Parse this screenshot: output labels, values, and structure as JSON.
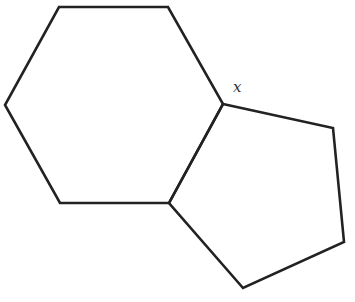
{
  "diagram": {
    "stroke_color": "#222222",
    "hexagon": {
      "points": [
        [
          59,
          7
        ],
        [
          168,
          7
        ],
        [
          223,
          104
        ],
        [
          169,
          203
        ],
        [
          60,
          203
        ],
        [
          5,
          105
        ]
      ]
    },
    "pentagon": {
      "points": [
        [
          223,
          104
        ],
        [
          333,
          128
        ],
        [
          344,
          242
        ],
        [
          243,
          288
        ],
        [
          169,
          203
        ]
      ]
    },
    "angle_label": {
      "text": "x",
      "x": 233,
      "y": 92
    }
  }
}
